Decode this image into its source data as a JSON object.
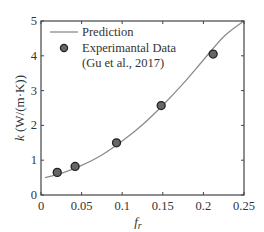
{
  "chart_data": {
    "type": "line",
    "title": "",
    "xlabel": "f_r",
    "ylabel": "k (W/(m·K))",
    "xlim": [
      0,
      0.25
    ],
    "ylim": [
      0,
      5
    ],
    "xticks": [
      0,
      0.05,
      0.1,
      0.15,
      0.2,
      0.25
    ],
    "xtick_labels": [
      "0",
      "0.05",
      "0.1",
      "0.15",
      "0.2",
      "0.25"
    ],
    "yticks": [
      0,
      1,
      2,
      3,
      4,
      5
    ],
    "ytick_labels": [
      "0",
      "1",
      "2",
      "3",
      "4",
      "5"
    ],
    "grid": false,
    "legend_position": "upper left",
    "series": [
      {
        "name": "Prediction",
        "kind": "line",
        "color": "#8c8c8c",
        "x": [
          0.005,
          0.025,
          0.05,
          0.075,
          0.1,
          0.125,
          0.15,
          0.175,
          0.2,
          0.225,
          0.25
        ],
        "values": [
          0.5,
          0.62,
          0.85,
          1.15,
          1.55,
          2.02,
          2.58,
          3.2,
          3.88,
          4.55,
          5.05
        ]
      },
      {
        "name": "Experimantal Data (Gu et al., 2017)",
        "kind": "scatter",
        "color": "#555555",
        "x": [
          0.02,
          0.042,
          0.093,
          0.148,
          0.212
        ],
        "values": [
          0.65,
          0.82,
          1.5,
          2.57,
          4.05
        ]
      }
    ]
  },
  "labels": {
    "x_axis": "f",
    "x_axis_sub": "r",
    "y_axis_italic": "k",
    "y_axis_rest": " (W/(m·K))",
    "legend_line": "Prediction",
    "legend_marker_1": "Experimantal Data",
    "legend_marker_2": "(Gu et al., 2017)"
  }
}
